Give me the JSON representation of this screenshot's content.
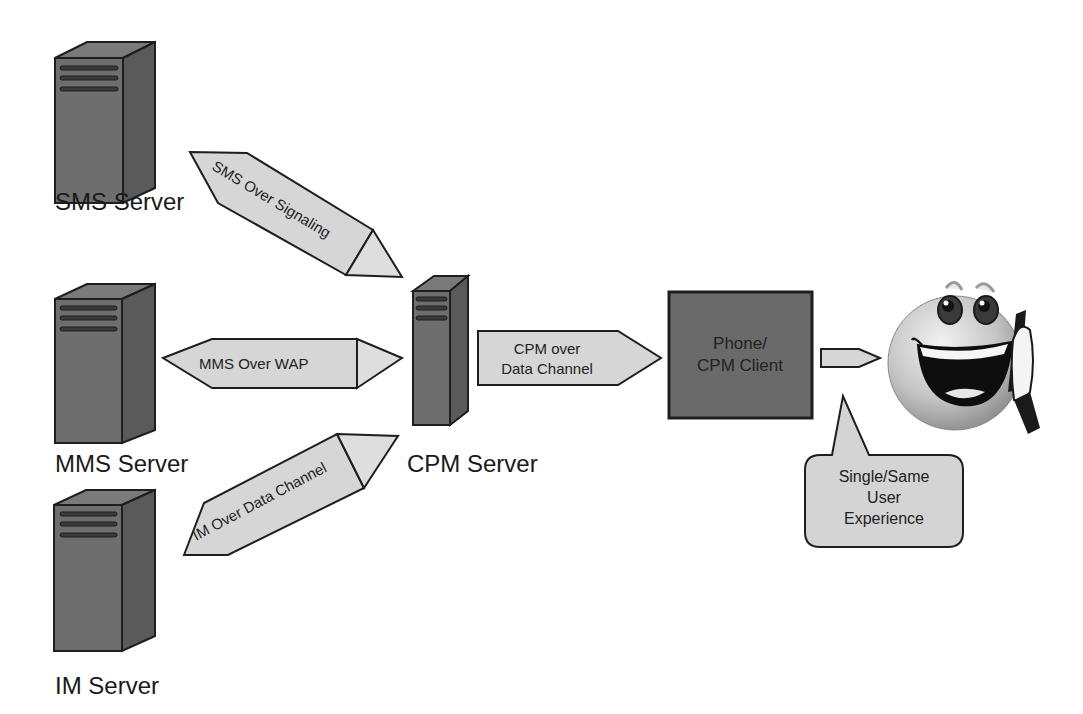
{
  "diagram": {
    "servers": [
      {
        "id": "sms",
        "label": "SMS Server"
      },
      {
        "id": "mms",
        "label": "MMS Server"
      },
      {
        "id": "im",
        "label": "IM Server"
      },
      {
        "id": "cpm",
        "label": "CPM Server"
      }
    ],
    "arrows": {
      "sms": "SMS Over Signaling",
      "mms": "MMS Over WAP",
      "im": "IM Over Data Channel",
      "cpm_line1": "CPM over",
      "cpm_line2": "Data Channel"
    },
    "client": {
      "line1": "Phone/",
      "line2": "CPM Client"
    },
    "callout": {
      "line1": "Single/Same",
      "line2": "User",
      "line3": "Experience"
    },
    "user_icon": "smiley-on-phone-icon"
  },
  "colors": {
    "server_front": "#6e6e6e",
    "server_side": "#5a5a5a",
    "server_top": "#7a7a7a",
    "arrow_fill": "#d6d6d6",
    "arrow_tip": "#dedede",
    "client_box": "#6a6a6a",
    "callout_fill": "#d4d4d4",
    "outline": "#1e1e1e"
  }
}
